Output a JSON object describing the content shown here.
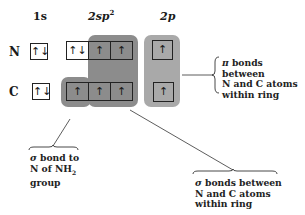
{
  "headers": {
    "col1": "1s",
    "col2_base": "2sp",
    "col2_sup": "2",
    "col3": "2p"
  },
  "rows": [
    {
      "label": "N",
      "s1": "↑↓",
      "sp2": [
        "↑↓",
        "↑",
        "↑"
      ],
      "p": "↑"
    },
    {
      "label": "C",
      "s1": "↑↓",
      "sp2": [
        "↑",
        "↑",
        "↑"
      ],
      "p": "↑"
    }
  ],
  "annotations": {
    "pi": {
      "symbol": "π",
      "lines": [
        "bonds between",
        "N and C atoms",
        "within ring"
      ]
    },
    "sigma_nh2": {
      "symbol": "σ",
      "line1": "bond to",
      "line2_pre": "N of NH",
      "line2_sub": "2",
      "line3": "group"
    },
    "sigma_ring": {
      "symbol": "σ",
      "lines": [
        "bonds between",
        "N and C atoms",
        "within ring"
      ]
    }
  },
  "colors": {
    "sigma_shade": "#8c8c8c",
    "pi_shade": "#a9a9a9",
    "box_border": "#222222"
  }
}
